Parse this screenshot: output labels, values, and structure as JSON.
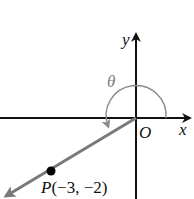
{
  "diagram": {
    "type": "coordinate-plane-angle",
    "axes": {
      "x_label": "x",
      "y_label": "y",
      "origin_label": "O"
    },
    "angle": {
      "label": "θ",
      "description": "standard-position angle measured counterclockwise from positive x-axis to terminal ray through P"
    },
    "point": {
      "name": "P",
      "coords_text": "(−3, −2)",
      "x": -3,
      "y": -2
    },
    "colors": {
      "axes": "#111111",
      "terminal_ray": "#7a7a7a",
      "arc": "#8a8a8a",
      "point": "#000000",
      "background": "#ffffff"
    }
  }
}
